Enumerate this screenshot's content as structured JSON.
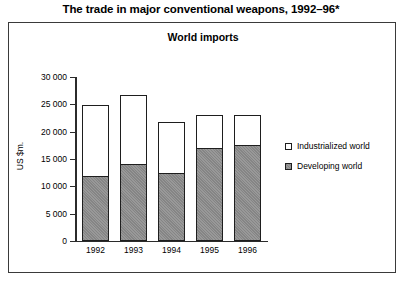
{
  "figure": {
    "title": "The trade in major conventional weapons, 1992–96*"
  },
  "legend": {
    "items": [
      {
        "label": "Industrialized world",
        "swatch": "white-square-icon",
        "color": "#ffffff"
      },
      {
        "label": "Developing world",
        "swatch": "gray-square-icon",
        "color": "#8d8d8d"
      }
    ]
  },
  "chart_data": {
    "type": "bar",
    "stacked": true,
    "title": "World imports",
    "xlabel": "",
    "ylabel": "US $m.",
    "categories": [
      "1992",
      "1993",
      "1994",
      "1995",
      "1996"
    ],
    "series": [
      {
        "name": "Developing world",
        "color": "#8d8d8d",
        "values": [
          11800,
          14000,
          12400,
          17000,
          17400
        ]
      },
      {
        "name": "Industrialized world",
        "color": "#ffffff",
        "values": [
          13000,
          12700,
          9200,
          6000,
          5600
        ]
      }
    ],
    "totals": [
      24800,
      26700,
      21600,
      23000,
      23000
    ],
    "ylim": [
      0,
      30000
    ],
    "yticks": [
      0,
      5000,
      10000,
      15000,
      20000,
      25000,
      30000
    ],
    "ytick_labels": [
      "0",
      "5 000",
      "10 000",
      "15 000",
      "20 000",
      "25 000",
      "30 000"
    ],
    "grid": false,
    "legend_position": "right"
  }
}
